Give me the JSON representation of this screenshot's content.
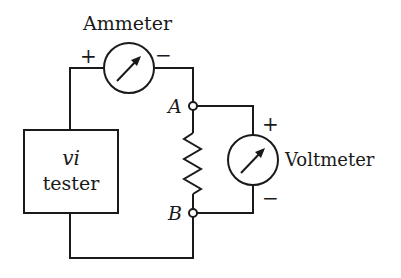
{
  "diagram": {
    "type": "circuit",
    "colors": {
      "line": "#1a1a1a",
      "background": "#ffffff"
    },
    "ammeter": {
      "label": "Ammeter",
      "plus": "+",
      "minus": "−"
    },
    "tester": {
      "line1": "vi",
      "line2": "tester"
    },
    "voltmeter": {
      "label": "Voltmeter",
      "plus": "+",
      "minus": "−"
    },
    "nodes": {
      "a": "A",
      "b": "B"
    },
    "resistor": {
      "name": "resistor"
    }
  }
}
